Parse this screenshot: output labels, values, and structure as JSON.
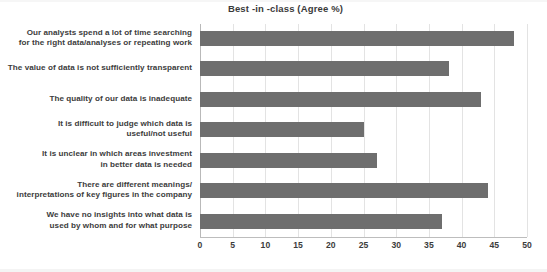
{
  "chart_data": {
    "type": "bar",
    "orientation": "horizontal",
    "title": "Best -in -class (Agree %)",
    "xlabel": "",
    "ylabel": "",
    "xlim": [
      0,
      50
    ],
    "xticks": [
      0,
      5,
      10,
      15,
      20,
      25,
      30,
      35,
      40,
      45,
      50
    ],
    "grid": true,
    "legend": null,
    "bar_color": "#6e6e6e",
    "categories": [
      "Our analysts spend a lot of time searching for the right data/analyses or repeating work",
      "The value of data is not sufficiently transparent",
      "The quality of our data is inadequate",
      "It is difficult to judge which data is useful/not useful",
      "It is unclear in which areas investment in better data is needed",
      "There are different meanings/ interpretations of key figures in the company",
      "We have no insights into what data is used by whom and for what purpose"
    ],
    "category_lines": [
      [
        "Our analysts spend a lot of time searching",
        "for the right data/analyses or repeating work"
      ],
      [
        "The value of data is not sufficiently transparent"
      ],
      [
        "The quality of our data is inadequate"
      ],
      [
        "It is difficult to judge which data is",
        "useful/not useful"
      ],
      [
        "It is unclear in which areas investment",
        "in better data is needed"
      ],
      [
        "There are different meanings/",
        "interpretations of key figures in the company"
      ],
      [
        "We have no insights into what data is",
        "used by whom and for what purpose"
      ]
    ],
    "values": [
      48,
      38,
      43,
      25,
      27,
      44,
      37
    ]
  }
}
